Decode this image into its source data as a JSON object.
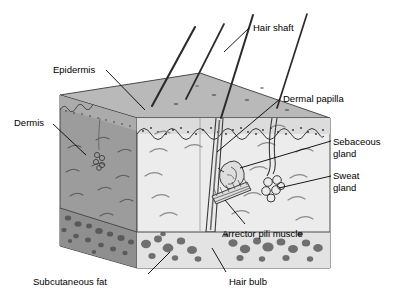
{
  "diagram": {
    "type": "anatomical-block-diagram",
    "projection": "isometric-cutaway-block",
    "style": "grayscale line drawing"
  },
  "colors": {
    "background": "#ffffff",
    "left_face": "#9c9c9c",
    "front_face": "#ececec",
    "top_face": "#b9b9b9",
    "fat_layer_front": "#e3e3e3",
    "fat_layer_left": "#8f8f8f",
    "adipocyte": "#6f6f6f",
    "outline": "#4a4a4a",
    "hair": "#2b2b2b",
    "text": "#000000",
    "leader_line": "#000000"
  },
  "labels": [
    {
      "id": "epidermis",
      "text": "Epidermis",
      "x": 53,
      "y": 64,
      "align": "left"
    },
    {
      "id": "dermis",
      "text": "Dermis",
      "x": 14,
      "y": 117,
      "align": "left"
    },
    {
      "id": "subcutaneous_fat",
      "text": "Subcutaneous fat",
      "x": 33,
      "y": 276,
      "align": "left"
    },
    {
      "id": "hair_shaft",
      "text": "Hair shaft",
      "x": 253,
      "y": 22,
      "align": "left"
    },
    {
      "id": "dermal_papilla",
      "text": "Dermal papilla",
      "x": 283,
      "y": 93,
      "align": "left"
    },
    {
      "id": "sebaceous_gland",
      "text": "Sebaceous\ngland",
      "x": 333,
      "y": 136,
      "align": "left"
    },
    {
      "id": "sweat_gland",
      "text": "Sweat\ngland",
      "x": 333,
      "y": 170,
      "align": "left"
    },
    {
      "id": "arrector_pili_muscle",
      "text": "Arrector pili muscle",
      "x": 222,
      "y": 228,
      "align": "left"
    },
    {
      "id": "hair_bulb",
      "text": "Hair bulb",
      "x": 229,
      "y": 276,
      "align": "left"
    }
  ],
  "structures": [
    {
      "id": "hair-shaft",
      "name": "hair shaft",
      "count": 4
    },
    {
      "id": "hair-follicle",
      "name": "hair follicle",
      "count": 1
    },
    {
      "id": "hair-bulb",
      "name": "hair bulb",
      "count": 1
    },
    {
      "id": "sebaceous-gland",
      "name": "sebaceous gland",
      "count": 1
    },
    {
      "id": "sweat-gland",
      "name": "sweat gland",
      "count": 2
    },
    {
      "id": "arrector-pili-muscle",
      "name": "arrector pili muscle",
      "count": 1
    },
    {
      "id": "dermal-papilla",
      "name": "dermal papilla",
      "count": 1
    },
    {
      "id": "adipose-tissue",
      "name": "subcutaneous fat",
      "count": 1
    }
  ]
}
